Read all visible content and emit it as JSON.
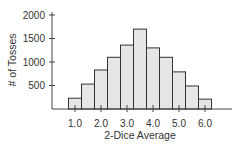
{
  "chart_data": {
    "type": "bar",
    "title": "",
    "xlabel": "2-Dice Average",
    "ylabel": "# of Tosses",
    "categories": [
      "1.0",
      "1.5",
      "2.0",
      "2.5",
      "3.0",
      "3.5",
      "4.0",
      "4.5",
      "5.0",
      "5.5",
      "6.0"
    ],
    "values": [
      230,
      530,
      830,
      1100,
      1360,
      1700,
      1300,
      1100,
      790,
      490,
      210
    ],
    "x_ticks": [
      "1.0",
      "2.0",
      "3.0",
      "4.0",
      "5.0",
      "6.0"
    ],
    "y_ticks": [
      "500",
      "1000",
      "1500",
      "2000"
    ],
    "ylim": [
      0,
      2100
    ],
    "grid": false,
    "legend": null,
    "colors": {
      "bar_fill": "#e6e6e6",
      "bar_stroke": "#333333",
      "axis": "#444444"
    }
  }
}
